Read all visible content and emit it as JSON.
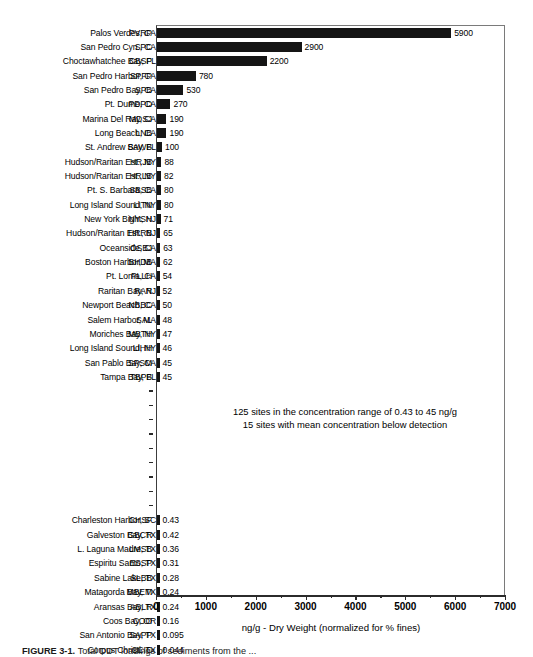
{
  "chart_data": {
    "type": "bar",
    "orientation": "horizontal",
    "title": "",
    "xlabel": "ng/g - Dry Weight (normalized for % fines)",
    "ylabel": "",
    "xlim": [
      0,
      7000
    ],
    "xticks": [
      0,
      1000,
      2000,
      3000,
      4000,
      5000,
      6000,
      7000
    ],
    "xtick_labels": [
      "0",
      "1000",
      "2000",
      "3000",
      "4000",
      "5000",
      "6000",
      "7000"
    ],
    "minor_ticks": [
      500,
      1500,
      2500,
      3500,
      4500,
      5500,
      6500
    ],
    "grid": false,
    "legend": null,
    "bar_color": "#151515",
    "categories": [
      "PVRP",
      "SPC",
      "CBSP",
      "SPFP",
      "SPB",
      "PDPD",
      "MDSJ",
      "LNB",
      "SAWB",
      "HRJB",
      "HRLB",
      "SBSB",
      "LITN",
      "NYSH",
      "HRRB",
      "OSBJ",
      "BHDB",
      "PLLH",
      "RAR",
      "NBBC",
      "SAL",
      "MBTH",
      "LIHH",
      "SPSM",
      "TBPB",
      "CHSF",
      "GBCR",
      "LMSB",
      "ESSP",
      "SLBB",
      "MBEM",
      "ABLR",
      "COO",
      "SAPP",
      "CCIC"
    ],
    "values": [
      5900,
      2900,
      2200,
      780,
      530,
      270,
      190,
      190,
      100,
      88,
      82,
      80,
      80,
      71,
      65,
      63,
      62,
      54,
      52,
      50,
      48,
      47,
      46,
      45,
      45,
      0.43,
      0.42,
      0.36,
      0.31,
      0.28,
      0.24,
      0.24,
      0.16,
      0.095,
      0.044
    ],
    "value_labels": [
      "5900",
      "2900",
      "2200",
      "780",
      "530",
      "270",
      "190",
      "190",
      "100",
      "88",
      "82",
      "80",
      "80",
      "71",
      "65",
      "63",
      "62",
      "54",
      "52",
      "50",
      "48",
      "47",
      "46",
      "45",
      "45",
      "0.43",
      "0.42",
      "0.36",
      "0.31",
      "0.28",
      "0.24",
      "0.24",
      "0.16",
      "0.095",
      "0.044"
    ],
    "site_names": [
      "Palos Verdes, CA",
      "San Pedro Cyn., CA",
      "Choctawhatchee Bay, FL",
      "San Pedro Harbor, CA",
      "San Pedro Bay, CA",
      "Pt. Dume, CA",
      "Marina Del Ray, CA",
      "Long Beach, CA",
      "St. Andrew Bay, FL",
      "Hudson/Raritan Est., NY",
      "Hudson/Raritan Est., NY",
      "Pt. S. Barbara, CA",
      "Long Island Sound, NY",
      "New York Bight, NJ",
      "Hudson/Raritan Est., NJ",
      "Oceanside, CA",
      "Boston Harbor, MA",
      "Pt. Loma, CA",
      "Raritan Bay, NJ",
      "Newport Beach, CA",
      "Salem Harbor, MA",
      "Moriches Bay, NY",
      "Long Island Sound, NY",
      "San Pablo Bay, CA",
      "Tampa Bay, FL",
      "Charleston Harbor, SC",
      "Galveston Bay, TX",
      "L. Laguna Madre, TX",
      "Espiritu Santo, TX",
      "Sabine Lake, TX",
      "Matagorda Bay, TX",
      "Aransas Bay, TX",
      "Coos Bay, OR",
      "San Antonio Bay, TX",
      "Corpus Christi, TX"
    ],
    "break_rows": 9,
    "annotations": [
      "125 sites in the concentration range of 0.43 to 45 ng/g",
      "15 sites with mean concentration below detection"
    ]
  },
  "caption": {
    "label": "FIGURE 3-1.",
    "text": "Total DDT loadings of sediments from the ..."
  }
}
